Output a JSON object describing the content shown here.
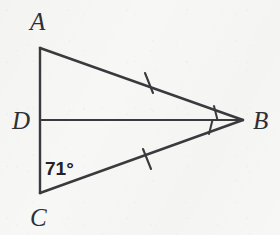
{
  "figure": {
    "type": "geometry-diagram",
    "background_color": "#f7f7f5",
    "stroke_color": "#3a3a3e",
    "label_color": "#2f2f33",
    "points": [
      {
        "id": "A",
        "label": "A",
        "x": 40,
        "y": 48,
        "label_x": 30,
        "label_y": 30
      },
      {
        "id": "D",
        "label": "D",
        "x": 40,
        "y": 120,
        "label_x": 12,
        "label_y": 129
      },
      {
        "id": "C",
        "label": "C",
        "x": 40,
        "y": 193,
        "label_x": 30,
        "label_y": 226
      },
      {
        "id": "B",
        "label": "B",
        "x": 243,
        "y": 120,
        "label_x": 253,
        "label_y": 129
      }
    ],
    "segments": [
      {
        "id": "AC",
        "from": "A",
        "to": "C",
        "name": "segment-ac"
      },
      {
        "id": "AB",
        "from": "A",
        "to": "B",
        "name": "segment-ab"
      },
      {
        "id": "CB",
        "from": "C",
        "to": "B",
        "name": "segment-cb"
      },
      {
        "id": "DB",
        "from": "D",
        "to": "B",
        "name": "segment-db"
      }
    ],
    "congruence_ticks": [
      {
        "on_segment": "AB",
        "count": 1,
        "cx": 149,
        "cy": 83
      },
      {
        "on_segment": "CB",
        "count": 1,
        "cx": 147,
        "cy": 159
      }
    ],
    "angle_marks": [
      {
        "at_vertex": "B",
        "between": "AB-DB",
        "x1": 214,
        "y1": 107,
        "x2": 217,
        "y2": 120
      },
      {
        "at_vertex": "B",
        "between": "DB-CB",
        "x1": 213,
        "y1": 120,
        "x2": 210,
        "y2": 133
      }
    ],
    "angle_measures": [
      {
        "at_vertex": "C",
        "value": "71",
        "unit": "°",
        "text": "71°",
        "x": 45,
        "y": 175
      }
    ]
  }
}
